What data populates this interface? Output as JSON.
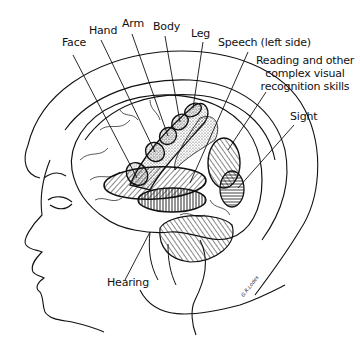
{
  "figure": {
    "labels": {
      "face": "Face",
      "hand": "Hand",
      "arm": "Arm",
      "body": "Body",
      "leg": "Leg",
      "speech": "Speech (left side)",
      "reading_line1": "Reading and other",
      "reading_line2": "complex visual",
      "reading_line3": "recognition skills",
      "sight": "Sight",
      "hearing": "Hearing"
    },
    "signature": "G.R.Lodes"
  },
  "colors": {
    "ink": "#111111",
    "background": "#ffffff"
  }
}
